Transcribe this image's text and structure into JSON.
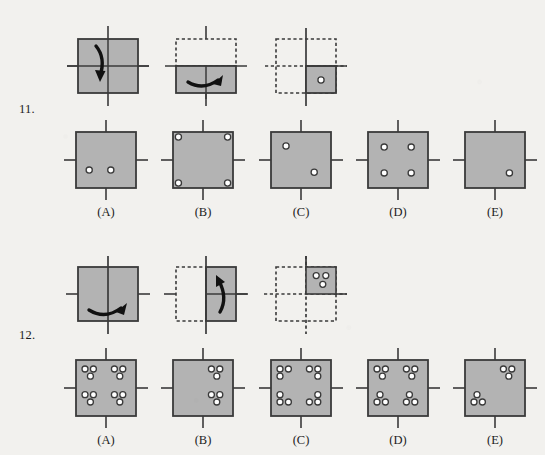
{
  "page": {
    "background_color": "#f2f1ee",
    "square_fill": "#b3b3b3",
    "square_stroke": "#3a3a3a",
    "hole_fill": "#ffffff",
    "axis_color": "#3a3a3a",
    "arrow_color": "#111111",
    "dash_color": "#3a3a3a"
  },
  "questions": [
    {
      "number": "11.",
      "fold_steps": [
        {
          "name": "step-1-full-square-fold-down",
          "shape": "full-square",
          "axis": "vertical-through-center-and-horizontal-fold-line",
          "arrow": "curved-arrow-down",
          "dashed_part": "none",
          "holes": []
        },
        {
          "name": "step-2-folded-bottom-half",
          "shape": "bottom-half",
          "axis": "vertical-through-center-and-horizontal-fold-line",
          "arrow": "curved-arrow-right-horizontal",
          "dashed_part": "top-half",
          "holes": []
        },
        {
          "name": "step-3-punched-quarter",
          "shape": "bottom-right-quarter",
          "axis": "vertical-and-horizontal-fold-lines",
          "arrow": "none",
          "dashed_part": "other-three-quarters",
          "holes": [
            {
              "x": 0.5,
              "y": 0.5
            }
          ]
        }
      ],
      "options": [
        {
          "label": "(A)",
          "name": "option-a",
          "holes": [
            {
              "x": 0.22,
              "y": 0.68
            },
            {
              "x": 0.58,
              "y": 0.68
            }
          ]
        },
        {
          "label": "(B)",
          "name": "option-b",
          "holes": [
            {
              "x": 0.09,
              "y": 0.09
            },
            {
              "x": 0.91,
              "y": 0.09
            },
            {
              "x": 0.09,
              "y": 0.91
            },
            {
              "x": 0.91,
              "y": 0.91
            }
          ]
        },
        {
          "label": "(C)",
          "name": "option-c",
          "holes": [
            {
              "x": 0.25,
              "y": 0.25
            },
            {
              "x": 0.72,
              "y": 0.72
            }
          ]
        },
        {
          "label": "(D)",
          "name": "option-d",
          "holes": [
            {
              "x": 0.27,
              "y": 0.27
            },
            {
              "x": 0.72,
              "y": 0.27
            },
            {
              "x": 0.27,
              "y": 0.73
            },
            {
              "x": 0.72,
              "y": 0.73
            }
          ]
        },
        {
          "label": "(E)",
          "name": "option-e",
          "holes": [
            {
              "x": 0.74,
              "y": 0.73
            }
          ]
        }
      ]
    },
    {
      "number": "12.",
      "fold_steps": [
        {
          "name": "step-1-full-square-fold-right",
          "shape": "full-square",
          "axis": "vertical-fold-line-and-horizontal-axis",
          "arrow": "curved-arrow-right-horizontal",
          "dashed_part": "none",
          "holes": []
        },
        {
          "name": "step-2-folded-right-half",
          "shape": "right-half",
          "axis": "vertical-fold-line-and-horizontal-axis",
          "arrow": "curved-arrow-up",
          "dashed_part": "left-half",
          "holes": []
        },
        {
          "name": "step-3-punched-quarter",
          "shape": "top-right-quarter",
          "axis": "vertical-and-horizontal-fold-lines",
          "arrow": "none",
          "dashed_part": "other-three-quarters",
          "holes": [
            {
              "x": 0.34,
              "y": 0.32
            },
            {
              "x": 0.66,
              "y": 0.32
            },
            {
              "x": 0.56,
              "y": 0.64
            }
          ]
        }
      ],
      "options": [
        {
          "label": "(A)",
          "name": "option-a",
          "holes": [
            {
              "x": 0.15,
              "y": 0.16
            },
            {
              "x": 0.29,
              "y": 0.16
            },
            {
              "x": 0.24,
              "y": 0.29
            },
            {
              "x": 0.64,
              "y": 0.16
            },
            {
              "x": 0.78,
              "y": 0.16
            },
            {
              "x": 0.73,
              "y": 0.29
            },
            {
              "x": 0.15,
              "y": 0.62
            },
            {
              "x": 0.29,
              "y": 0.62
            },
            {
              "x": 0.24,
              "y": 0.75
            },
            {
              "x": 0.64,
              "y": 0.62
            },
            {
              "x": 0.78,
              "y": 0.62
            },
            {
              "x": 0.73,
              "y": 0.75
            }
          ]
        },
        {
          "label": "(B)",
          "name": "option-b",
          "holes": [
            {
              "x": 0.64,
              "y": 0.16
            },
            {
              "x": 0.78,
              "y": 0.16
            },
            {
              "x": 0.73,
              "y": 0.29
            },
            {
              "x": 0.64,
              "y": 0.62
            },
            {
              "x": 0.78,
              "y": 0.62
            },
            {
              "x": 0.73,
              "y": 0.75
            }
          ]
        },
        {
          "label": "(C)",
          "name": "option-c",
          "holes": [
            {
              "x": 0.15,
              "y": 0.16
            },
            {
              "x": 0.29,
              "y": 0.16
            },
            {
              "x": 0.15,
              "y": 0.29
            },
            {
              "x": 0.64,
              "y": 0.16
            },
            {
              "x": 0.78,
              "y": 0.16
            },
            {
              "x": 0.78,
              "y": 0.29
            },
            {
              "x": 0.15,
              "y": 0.62
            },
            {
              "x": 0.15,
              "y": 0.75
            },
            {
              "x": 0.29,
              "y": 0.75
            },
            {
              "x": 0.78,
              "y": 0.62
            },
            {
              "x": 0.64,
              "y": 0.75
            },
            {
              "x": 0.78,
              "y": 0.75
            }
          ]
        },
        {
          "label": "(D)",
          "name": "option-d",
          "holes": [
            {
              "x": 0.15,
              "y": 0.16
            },
            {
              "x": 0.29,
              "y": 0.16
            },
            {
              "x": 0.24,
              "y": 0.29
            },
            {
              "x": 0.64,
              "y": 0.16
            },
            {
              "x": 0.78,
              "y": 0.16
            },
            {
              "x": 0.73,
              "y": 0.29
            },
            {
              "x": 0.2,
              "y": 0.62
            },
            {
              "x": 0.15,
              "y": 0.75
            },
            {
              "x": 0.29,
              "y": 0.75
            },
            {
              "x": 0.69,
              "y": 0.62
            },
            {
              "x": 0.64,
              "y": 0.75
            },
            {
              "x": 0.78,
              "y": 0.75
            }
          ]
        },
        {
          "label": "(E)",
          "name": "option-e",
          "holes": [
            {
              "x": 0.64,
              "y": 0.16
            },
            {
              "x": 0.78,
              "y": 0.16
            },
            {
              "x": 0.73,
              "y": 0.29
            },
            {
              "x": 0.2,
              "y": 0.62
            },
            {
              "x": 0.15,
              "y": 0.75
            },
            {
              "x": 0.29,
              "y": 0.75
            }
          ]
        }
      ]
    }
  ]
}
